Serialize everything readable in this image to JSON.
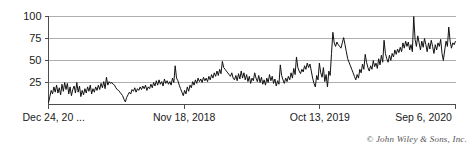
{
  "chart_data": {
    "type": "line",
    "title": "",
    "xlabel": "",
    "ylabel": "",
    "ylim": [
      0,
      100
    ],
    "yticks": [
      25,
      50,
      75,
      100
    ],
    "ytick_labels": [
      "25",
      "50",
      "75",
      "100"
    ],
    "grid": true,
    "legend": null,
    "xtick_labels": [
      "Dec 24, 20 ...",
      "Nov 18, 2018",
      "Oct 13, 2019",
      "Sep 6, 2020"
    ],
    "xtick_positions": [
      0,
      0.3333,
      0.6667,
      1.0
    ],
    "series": [
      {
        "name": "search interest",
        "color": "#111111",
        "values": [
          2,
          9,
          16,
          12,
          20,
          14,
          22,
          13,
          19,
          11,
          23,
          15,
          25,
          17,
          24,
          12,
          20,
          10,
          17,
          21,
          13,
          25,
          14,
          21,
          9,
          16,
          11,
          18,
          13,
          20,
          15,
          22,
          12,
          18,
          14,
          20,
          16,
          22,
          17,
          24,
          19,
          26,
          18,
          31,
          22,
          26,
          24,
          25,
          23,
          22,
          19,
          17,
          16,
          14,
          12,
          10,
          6,
          3,
          8,
          11,
          14,
          12,
          17,
          15,
          19,
          14,
          18,
          16,
          20,
          17,
          21,
          18,
          22,
          16,
          20,
          18,
          23,
          19,
          25,
          21,
          27,
          22,
          28,
          23,
          26,
          21,
          29,
          24,
          27,
          23,
          26,
          22,
          30,
          25,
          44,
          30,
          27,
          22,
          18,
          14,
          10,
          16,
          12,
          20,
          15,
          22,
          19,
          26,
          22,
          28,
          24,
          30,
          26,
          29,
          25,
          31,
          27,
          30,
          26,
          32,
          28,
          34,
          30,
          36,
          32,
          38,
          33,
          40,
          35,
          49,
          42,
          40,
          38,
          36,
          34,
          32,
          36,
          30,
          28,
          33,
          27,
          35,
          29,
          38,
          30,
          36,
          28,
          34,
          26,
          32,
          24,
          30,
          27,
          36,
          30,
          26,
          33,
          25,
          31,
          23,
          28,
          22,
          30,
          25,
          34,
          27,
          32,
          24,
          29,
          21,
          27,
          23,
          45,
          33,
          28,
          24,
          30,
          26,
          32,
          28,
          36,
          30,
          41,
          34,
          54,
          42,
          38,
          35,
          40,
          37,
          44,
          40,
          47,
          42,
          46,
          38,
          30,
          24,
          20,
          33,
          28,
          47,
          36,
          31,
          42,
          26,
          34,
          20,
          38,
          33,
          58,
          82,
          70,
          66,
          71,
          68,
          66,
          64,
          70,
          76,
          68,
          60,
          52,
          48,
          44,
          40,
          36,
          32,
          28,
          34,
          30,
          40,
          36,
          46,
          40,
          57,
          48,
          42,
          38,
          44,
          40,
          50,
          43,
          47,
          41,
          52,
          45,
          56,
          48,
          73,
          58,
          52,
          48,
          56,
          50,
          58,
          54,
          62,
          57,
          63,
          59,
          65,
          60,
          70,
          64,
          72,
          66,
          71,
          62,
          68,
          60,
          100,
          74,
          66,
          78,
          70,
          62,
          72,
          65,
          75,
          68,
          60,
          70,
          63,
          73,
          66,
          58,
          68,
          62,
          70,
          66,
          74,
          58,
          50,
          62,
          72,
          66,
          88,
          72,
          64,
          70,
          68,
          72
        ]
      }
    ]
  },
  "footer": {
    "copyright": "© John Wiley & Sons, Inc."
  }
}
